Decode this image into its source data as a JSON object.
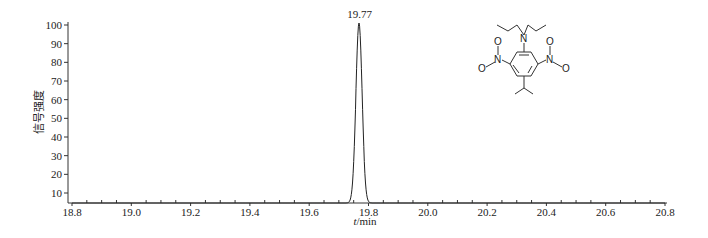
{
  "chart_data": {
    "type": "line",
    "title": "",
    "xlabel": "t/min",
    "ylabel": "信号强度",
    "xlim": [
      18.8,
      20.8
    ],
    "ylim": [
      5,
      100
    ],
    "x_ticks": [
      "18.8",
      "19.0",
      "19.2",
      "19.4",
      "19.6",
      "19.8",
      "20.0",
      "20.2",
      "20.4",
      "20.6",
      "20.8"
    ],
    "y_ticks": [
      "10",
      "20",
      "30",
      "40",
      "50",
      "60",
      "70",
      "80",
      "90",
      "100"
    ],
    "grid": false,
    "legend": null,
    "series": [
      {
        "name": "chromatogram",
        "x": [
          18.8,
          19.73,
          19.74,
          19.75,
          19.76,
          19.77,
          19.78,
          19.79,
          19.8,
          19.81,
          20.8
        ],
        "values": [
          5,
          5,
          12,
          40,
          85,
          100,
          85,
          40,
          12,
          5,
          5
        ]
      }
    ],
    "annotations": [
      {
        "text": "19.77",
        "x": 19.77,
        "y": 100
      }
    ],
    "inset": {
      "type": "chemical-structure",
      "atoms": [
        "N",
        "N",
        "O",
        "O",
        "N",
        "O",
        "O"
      ],
      "description": "N,N-dipropyl-2,6-dinitro-4-isopropylaniline (isopropalin)"
    }
  },
  "labels": {
    "peak": "19.77",
    "xlabel_italic": "t",
    "xlabel_rest": "/min",
    "ylabel": "信号强度",
    "mol_n_amine": "N",
    "mol_n_left": "N",
    "mol_n_right": "N",
    "mol_o_left_top": "O",
    "mol_o_left_bottom": "O",
    "mol_o_right_top": "O",
    "mol_o_right_bottom": "O"
  }
}
